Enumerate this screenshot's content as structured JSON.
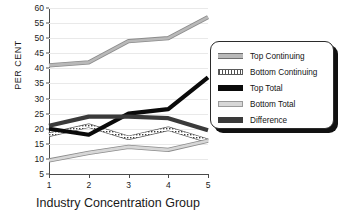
{
  "chart_data": {
    "type": "line",
    "title": "",
    "xlabel": "Industry Concentration Group",
    "ylabel": "PER CENT",
    "x": [
      1,
      2,
      3,
      4,
      5
    ],
    "xtick_labels": [
      "1",
      "2",
      "3",
      "4",
      "5"
    ],
    "ytick_labels": [
      "5",
      "10",
      "15",
      "20",
      "25",
      "30",
      "35",
      "40",
      "45",
      "50",
      "55",
      "60"
    ],
    "ylim": [
      5,
      60
    ],
    "xlim": [
      1,
      5
    ],
    "grid": "horizontal",
    "legend_position": "right",
    "series": [
      {
        "name": "Top Continuing",
        "values": [
          41,
          42,
          49,
          50,
          57
        ],
        "color": "#b9b9b9",
        "style": "light-gray-band"
      },
      {
        "name": "Bottom Continuing",
        "values": [
          18,
          21,
          17,
          20,
          16
        ],
        "color": "#4f4f4f",
        "style": "dotted-hatched-band"
      },
      {
        "name": "Top Total",
        "values": [
          20,
          18,
          25,
          26.5,
          37
        ],
        "color": "#0a0a0a",
        "style": "thick-black"
      },
      {
        "name": "Bottom Total",
        "values": [
          9.5,
          12,
          14,
          13,
          16
        ],
        "color": "#d7d7d7",
        "style": "light-gray-band"
      },
      {
        "name": "Difference",
        "values": [
          21,
          24,
          24,
          23.5,
          19.5
        ],
        "color": "#3a3a3a",
        "style": "thick-dark-gray"
      }
    ]
  },
  "legend": {
    "items": [
      {
        "label": "Top Continuing"
      },
      {
        "label": "Bottom Continuing"
      },
      {
        "label": "Top Total"
      },
      {
        "label": "Bottom Total"
      },
      {
        "label": "Difference"
      }
    ]
  }
}
